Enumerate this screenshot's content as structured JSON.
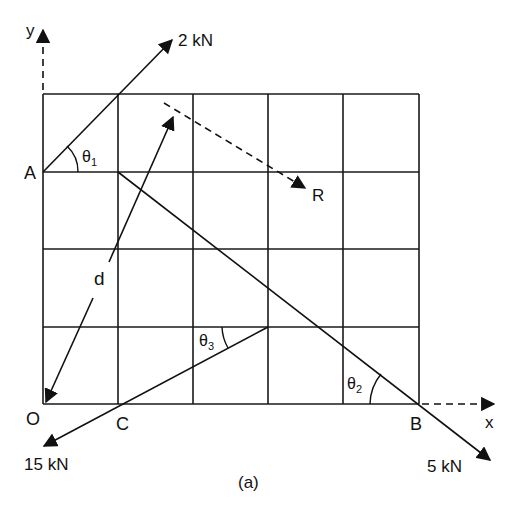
{
  "figure": {
    "caption": "(a)",
    "axes": {
      "x_label": "x",
      "y_label": "y"
    },
    "points": {
      "A": "A",
      "O": "O",
      "C": "C",
      "B": "B",
      "R": "R"
    },
    "forces": [
      {
        "label": "2 kN",
        "from": "A",
        "angle_label": "θ",
        "angle_sub": "1"
      },
      {
        "label": "5 kN",
        "through": "B",
        "angle_label": "θ",
        "angle_sub": "2"
      },
      {
        "label": "15 kN",
        "through": "C",
        "angle_label": "θ",
        "angle_sub": "3"
      }
    ],
    "distance_label": "d",
    "grid": {
      "columns": 5,
      "rows": 4
    },
    "colors": {
      "line": "#111111",
      "background": "#ffffff"
    }
  }
}
